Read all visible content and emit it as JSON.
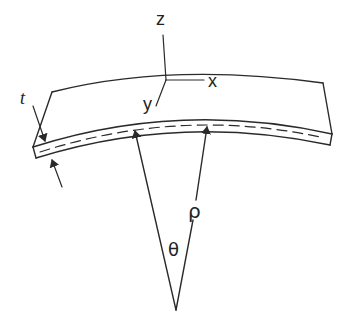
{
  "figure": {
    "stroke_color": "#2a2a2a",
    "background": "#ffffff"
  },
  "labels": {
    "z_axis": "z",
    "x_axis": "x",
    "y_axis": "y",
    "thickness": "t",
    "radius": "ρ",
    "angle": "θ"
  },
  "elements": {
    "plate": "curved-plate",
    "midplane": "dashed-neutral-surface",
    "radius_arrows": 2,
    "thickness_arrows": 2
  }
}
